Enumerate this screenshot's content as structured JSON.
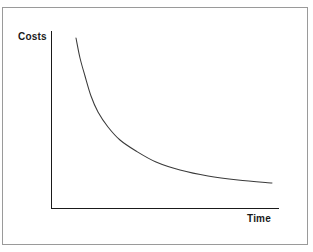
{
  "figure": {
    "background_color": "#ffffff",
    "frame_color": "#9a9a9a",
    "axis_color": "#1a1a1a",
    "curve_color": "#3a3a3a"
  },
  "axes": {
    "y_label": "Costs",
    "x_label": "Time"
  },
  "chart_data": {
    "type": "line",
    "title": "",
    "xlabel": "Time",
    "ylabel": "Costs",
    "grid": false,
    "legend": "none",
    "xlim": [
      0,
      100
    ],
    "ylim": [
      0,
      100
    ],
    "axis_ticks": {
      "x": [],
      "y": []
    },
    "annotations": [],
    "series": [
      {
        "name": "Costs over time",
        "description": "Monotonically decreasing convex decay curve (learning-curve / experience-curve shape): costs fall steeply at first, then flatten toward an asymptote.",
        "x": [
          11,
          16,
          21,
          27,
          35,
          45,
          55,
          66,
          78,
          90,
          100
        ],
        "y": [
          96,
          75,
          58,
          46,
          35,
          26,
          20,
          16,
          13,
          11,
          10
        ]
      }
    ],
    "curve_pixel_path": {
      "start": [
        76,
        38
      ],
      "end": [
        272,
        183
      ],
      "points": [
        [
          76,
          38
        ],
        [
          80,
          58
        ],
        [
          85,
          76
        ],
        [
          91,
          96
        ],
        [
          98,
          112
        ],
        [
          108,
          127
        ],
        [
          120,
          140
        ],
        [
          136,
          151
        ],
        [
          156,
          162
        ],
        [
          180,
          170
        ],
        [
          208,
          176
        ],
        [
          238,
          180
        ],
        [
          272,
          183
        ]
      ]
    },
    "axis_pixel_geometry": {
      "y_axis": [
        51,
        31,
        51,
        209
      ],
      "x_axis": [
        51,
        209,
        279,
        209
      ]
    }
  }
}
